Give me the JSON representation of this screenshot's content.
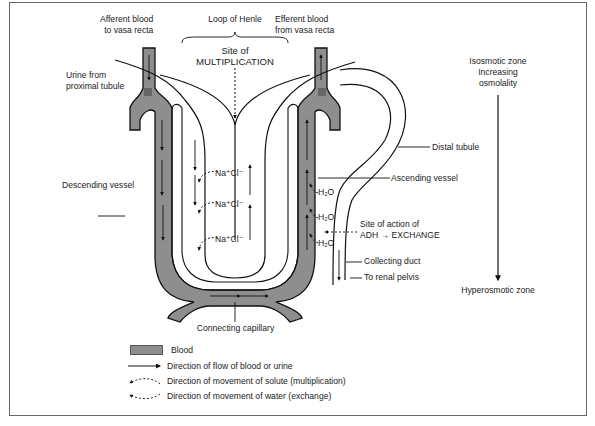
{
  "figure": {
    "title_labels": {
      "afferent": [
        "Afferent blood",
        "to vasa recta"
      ],
      "loop_of_henle": "Loop of Henle",
      "efferent": [
        "Efferent blood",
        "from vasa recta"
      ],
      "site_of": "Site of",
      "multiplication": "MULTIPLICATION"
    },
    "left_labels": {
      "urine_from": [
        "Urine from",
        "proximal tubule"
      ],
      "descending_vessel": "Descending vessel"
    },
    "right_labels": {
      "distal_tubule": "Distal tubule",
      "ascending_vessel": "Ascending vessel",
      "site_of_action": "Site of action of",
      "adh_exchange": "ADH → EXCHANGE",
      "collecting_duct": "Collecting duct",
      "to_renal_pelvis": "To renal pelvis"
    },
    "bottom_labels": {
      "connecting_capillary": "Connecting capillary"
    },
    "solute_labels": [
      "Na⁺Cl⁻",
      "Na⁺Cl⁻",
      "Na⁺Cl⁻"
    ],
    "water_labels": [
      "H₂O",
      "H₂O",
      "H₂O"
    ],
    "osmolality_axis": {
      "top": [
        "Isosmotic zone",
        "Increasing",
        "osmolality"
      ],
      "bottom": "Hyperosmotic zone"
    }
  },
  "legend": {
    "items": [
      {
        "icon": "blood-swatch",
        "label": "Blood"
      },
      {
        "icon": "solid-arrow",
        "label": "Direction of flow of blood or urine"
      },
      {
        "icon": "dashed-curved-arrow-left",
        "label": "Direction of movement of solute (multiplication)"
      },
      {
        "icon": "dashed-curved-arrow-left-down",
        "label": "Direction of movement of water (exchange)"
      }
    ]
  },
  "colors": {
    "blood": "#8e8e8e",
    "blood_dark": "#6e6e6e",
    "line": "#1a1a1a",
    "frame": "#666666"
  }
}
